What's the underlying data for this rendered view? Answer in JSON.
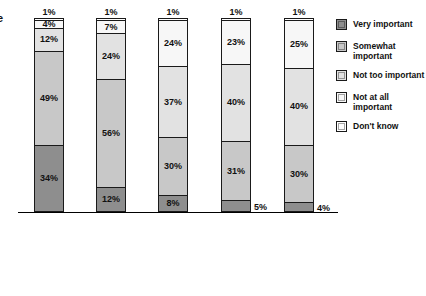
{
  "edge_glyph": "e",
  "chart_data": {
    "type": "bar",
    "subtype": "stacked-bar-100",
    "title": "",
    "xlabel": "",
    "ylabel": "",
    "ylim": [
      0,
      100
    ],
    "grid": false,
    "legend_position": "right",
    "categories": [
      "Under-graduate degree in journalism (Q.31a)",
      "Under-graduate degree in non-journalism major (Q.31b)",
      "Graduate degree in journalism (Q.31c)",
      "Under-graduate and graduate degrees in journalism (Q.31e)",
      "Graduate degree in non-journalism field (Q.31d)"
    ],
    "category_lines": [
      [
        "Under-",
        "graduate",
        "degree in",
        "journalism",
        "(Q.31a)"
      ],
      [
        "Under-",
        "graduate",
        "degree in",
        "non-",
        "journalism",
        "major",
        "(Q.31b)"
      ],
      [
        "Graduate",
        "degree in",
        "journalism",
        "(Q.31c)"
      ],
      [
        "Under-",
        "graduate",
        "and",
        "graduate",
        "degrees in",
        "journalism",
        "(Q.31e)"
      ],
      [
        "Graduate",
        "degree in",
        "non-",
        "journalism",
        "field",
        "(Q.31d)"
      ]
    ],
    "series": [
      {
        "name": "Very important",
        "color": "#8e8e8e",
        "values": [
          34,
          12,
          8,
          5,
          4
        ]
      },
      {
        "name": "Somewhat important",
        "color": "#c8c8c8",
        "values": [
          49,
          56,
          30,
          31,
          30
        ]
      },
      {
        "name": "Not too important",
        "color": "#e2e2e2",
        "values": [
          12,
          24,
          37,
          40,
          40
        ]
      },
      {
        "name": "Not at all important",
        "color": "#f7f7f7",
        "values": [
          4,
          7,
          24,
          23,
          25
        ]
      },
      {
        "name": "Don't know",
        "color": "#ffffff",
        "values": [
          1,
          1,
          1,
          1,
          1
        ]
      }
    ],
    "bars": [
      {
        "category_key": 0,
        "segments": [
          {
            "series": "Don't know",
            "value": 1,
            "label": "1%",
            "label_position": "above"
          },
          {
            "series": "Not at all important",
            "value": 4,
            "label": "4%",
            "label_position": "inside"
          },
          {
            "series": "Not too important",
            "value": 12,
            "label": "12%",
            "label_position": "inside"
          },
          {
            "series": "Somewhat important",
            "value": 49,
            "label": "49%",
            "label_position": "inside"
          },
          {
            "series": "Very important",
            "value": 34,
            "label": "34%",
            "label_position": "inside"
          }
        ]
      },
      {
        "category_key": 1,
        "segments": [
          {
            "series": "Don't know",
            "value": 1,
            "label": "1%",
            "label_position": "above"
          },
          {
            "series": "Not at all important",
            "value": 7,
            "label": "7%",
            "label_position": "inside"
          },
          {
            "series": "Not too important",
            "value": 24,
            "label": "24%",
            "label_position": "inside"
          },
          {
            "series": "Somewhat important",
            "value": 56,
            "label": "56%",
            "label_position": "inside"
          },
          {
            "series": "Very important",
            "value": 12,
            "label": "12%",
            "label_position": "inside"
          }
        ]
      },
      {
        "category_key": 2,
        "segments": [
          {
            "series": "Don't know",
            "value": 1,
            "label": "1%",
            "label_position": "above"
          },
          {
            "series": "Not at all important",
            "value": 24,
            "label": "24%",
            "label_position": "inside"
          },
          {
            "series": "Not too important",
            "value": 37,
            "label": "37%",
            "label_position": "inside"
          },
          {
            "series": "Somewhat important",
            "value": 30,
            "label": "30%",
            "label_position": "inside"
          },
          {
            "series": "Very important",
            "value": 8,
            "label": "8%",
            "label_position": "inside"
          }
        ]
      },
      {
        "category_key": 3,
        "segments": [
          {
            "series": "Don't know",
            "value": 1,
            "label": "1%",
            "label_position": "above"
          },
          {
            "series": "Not at all important",
            "value": 23,
            "label": "23%",
            "label_position": "inside"
          },
          {
            "series": "Not too important",
            "value": 40,
            "label": "40%",
            "label_position": "inside"
          },
          {
            "series": "Somewhat important",
            "value": 31,
            "label": "31%",
            "label_position": "inside"
          },
          {
            "series": "Very important",
            "value": 5,
            "label": "5%",
            "label_position": "outside-right"
          }
        ]
      },
      {
        "category_key": 4,
        "segments": [
          {
            "series": "Don't know",
            "value": 1,
            "label": "1%",
            "label_position": "above"
          },
          {
            "series": "Not at all important",
            "value": 25,
            "label": "25%",
            "label_position": "inside"
          },
          {
            "series": "Not too important",
            "value": 40,
            "label": "40%",
            "label_position": "inside"
          },
          {
            "series": "Somewhat important",
            "value": 30,
            "label": "30%",
            "label_position": "inside"
          },
          {
            "series": "Very important",
            "value": 4,
            "label": "4%",
            "label_position": "outside-right"
          }
        ]
      }
    ],
    "legend": [
      {
        "label": "Very important",
        "color": "#8e8e8e"
      },
      {
        "label": "Somewhat important",
        "color": "#c8c8c8"
      },
      {
        "label": "Not too important",
        "color": "#e2e2e2"
      },
      {
        "label": "Not at all important",
        "color": "#f7f7f7"
      },
      {
        "label": "Don't know",
        "color": "#ffffff"
      }
    ],
    "legend_label_lines": [
      [
        "Very important"
      ],
      [
        "Somewhat",
        "important"
      ],
      [
        "Not too important"
      ],
      [
        "Not at all important"
      ],
      [
        "Don't know"
      ]
    ]
  }
}
